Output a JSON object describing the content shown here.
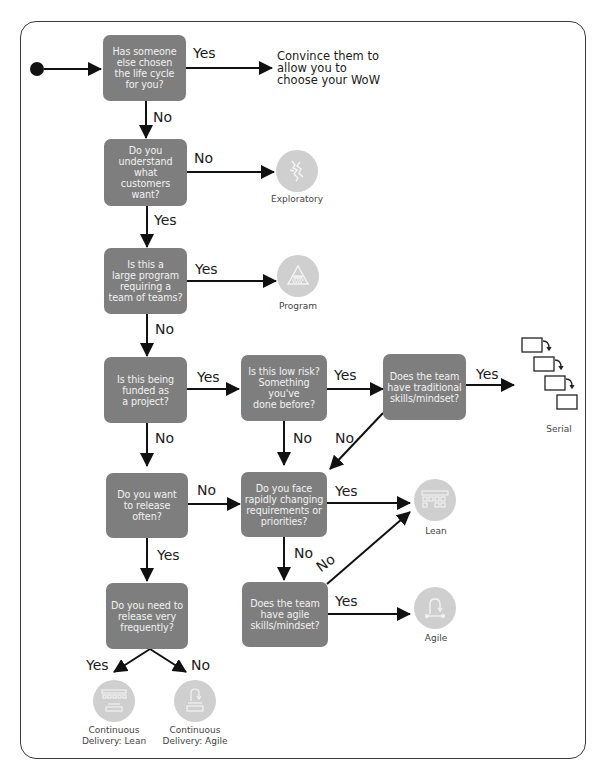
{
  "diagram": {
    "type": "flowchart",
    "start": {
      "label": "start"
    },
    "colors": {
      "decision_fill": "#7e7e7e",
      "decision_text": "#f2f2f2",
      "outcome_circle": "#cfcfcf",
      "line": "#111111",
      "frame": "#3a3a3a"
    },
    "decisions": [
      {
        "id": "d1",
        "text": "Has someone\nelse chosen\nthe life cycle\nfor you?"
      },
      {
        "id": "d2",
        "text": "Do you\nunderstand\nwhat\ncustomers\nwant?"
      },
      {
        "id": "d3",
        "text": "Is this a\nlarge program\nrequiring a\nteam of teams?"
      },
      {
        "id": "d4",
        "text": "Is this being\nfunded as\na project?"
      },
      {
        "id": "d5",
        "text": "Is this low risk?\nSomething\nyou've\ndone before?"
      },
      {
        "id": "d6",
        "text": "Does the team\nhave traditional\nskills/mindset?"
      },
      {
        "id": "d7",
        "text": "Do you want\nto release\noften?"
      },
      {
        "id": "d8",
        "text": "Do you face\nrapidly changing\nrequirements or\npriorities?"
      },
      {
        "id": "d9",
        "text": "Do you need to\nrelease very\nfrequently?"
      },
      {
        "id": "d10",
        "text": "Does the team\nhave agile\nskills/mindset?"
      }
    ],
    "outcomes": [
      {
        "id": "convince",
        "text": "Convince them to\nallow you to\nchoose your WoW",
        "icon": null
      },
      {
        "id": "exploratory",
        "label": "Exploratory",
        "icon": "exploratory-icon"
      },
      {
        "id": "program",
        "label": "Program",
        "icon": "program-icon"
      },
      {
        "id": "serial",
        "label": "Serial",
        "icon": "serial-phases-icon"
      },
      {
        "id": "lean",
        "label": "Lean",
        "icon": "lean-board-icon"
      },
      {
        "id": "agile",
        "label": "Agile",
        "icon": "agile-cycle-icon"
      },
      {
        "id": "cd_lean",
        "label": "Continuous\nDelivery: Lean",
        "icon": "cd-lean-icon"
      },
      {
        "id": "cd_agile",
        "label": "Continuous\nDelivery: Agile",
        "icon": "cd-agile-icon"
      }
    ],
    "edges": [
      {
        "from": "start",
        "to": "d1",
        "label": ""
      },
      {
        "from": "d1",
        "to": "convince",
        "label": "Yes"
      },
      {
        "from": "d1",
        "to": "d2",
        "label": "No"
      },
      {
        "from": "d2",
        "to": "exploratory",
        "label": "No"
      },
      {
        "from": "d2",
        "to": "d3",
        "label": "Yes"
      },
      {
        "from": "d3",
        "to": "program",
        "label": "Yes"
      },
      {
        "from": "d3",
        "to": "d4",
        "label": "No"
      },
      {
        "from": "d4",
        "to": "d5",
        "label": "Yes"
      },
      {
        "from": "d4",
        "to": "d7",
        "label": "No"
      },
      {
        "from": "d5",
        "to": "d6",
        "label": "Yes"
      },
      {
        "from": "d5",
        "to": "d8",
        "label": "No"
      },
      {
        "from": "d6",
        "to": "serial",
        "label": "Yes"
      },
      {
        "from": "d6",
        "to": "d8",
        "label": "No"
      },
      {
        "from": "d7",
        "to": "d8",
        "label": "No"
      },
      {
        "from": "d7",
        "to": "d9",
        "label": "Yes"
      },
      {
        "from": "d8",
        "to": "lean",
        "label": "Yes"
      },
      {
        "from": "d8",
        "to": "d10",
        "label": "No"
      },
      {
        "from": "d10",
        "to": "agile",
        "label": "Yes"
      },
      {
        "from": "d10",
        "to": "lean",
        "label": "No"
      },
      {
        "from": "d9",
        "to": "cd_lean",
        "label": "Yes"
      },
      {
        "from": "d9",
        "to": "cd_agile",
        "label": "No"
      }
    ]
  }
}
